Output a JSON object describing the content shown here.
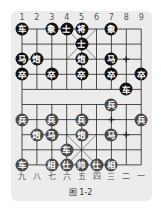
{
  "board": {
    "top_labels": [
      "1",
      "2",
      "3",
      "4",
      "5",
      "6",
      "7",
      "8",
      "9"
    ],
    "bottom_labels": [
      "九",
      "八",
      "七",
      "六",
      "五",
      "四",
      "三",
      "二",
      "一"
    ],
    "pieces": [
      {
        "char": "车",
        "side": "black",
        "col": 1,
        "row": 0
      },
      {
        "char": "象",
        "side": "black",
        "col": 3,
        "row": 0
      },
      {
        "char": "士",
        "side": "black",
        "col": 4,
        "row": 0
      },
      {
        "char": "将",
        "side": "black",
        "col": 5,
        "row": 0
      },
      {
        "char": "象",
        "side": "black",
        "col": 7,
        "row": 0
      },
      {
        "char": "士",
        "side": "black",
        "col": 5,
        "row": 1
      },
      {
        "char": "马",
        "side": "black",
        "col": 1,
        "row": 2
      },
      {
        "char": "炮",
        "side": "black",
        "col": 2,
        "row": 2
      },
      {
        "char": "炮",
        "side": "black",
        "col": 5,
        "row": 2
      },
      {
        "char": "马",
        "side": "black",
        "col": 7,
        "row": 2
      },
      {
        "char": "卒",
        "side": "black",
        "col": 1,
        "row": 3
      },
      {
        "char": "卒",
        "side": "black",
        "col": 3,
        "row": 3
      },
      {
        "char": "卒",
        "side": "black",
        "col": 5,
        "row": 3
      },
      {
        "char": "卒",
        "side": "black",
        "col": 7,
        "row": 3
      },
      {
        "char": "卒",
        "side": "black",
        "col": 9,
        "row": 3
      },
      {
        "char": "车",
        "side": "black",
        "col": 8,
        "row": 4
      },
      {
        "char": "兵",
        "side": "red",
        "col": 7,
        "row": 5
      },
      {
        "char": "兵",
        "side": "red",
        "col": 1,
        "row": 6
      },
      {
        "char": "兵",
        "side": "red",
        "col": 3,
        "row": 6
      },
      {
        "char": "兵",
        "side": "red",
        "col": 5,
        "row": 6
      },
      {
        "char": "兵",
        "side": "red",
        "col": 9,
        "row": 6
      },
      {
        "char": "炮",
        "side": "red",
        "col": 2,
        "row": 7
      },
      {
        "char": "马",
        "side": "red",
        "col": 3,
        "row": 7
      },
      {
        "char": "炮",
        "side": "red",
        "col": 5,
        "row": 7
      },
      {
        "char": "马",
        "side": "red",
        "col": 7,
        "row": 7
      },
      {
        "char": "车",
        "side": "red",
        "col": 4,
        "row": 8
      },
      {
        "char": "车",
        "side": "red",
        "col": 1,
        "row": 9
      },
      {
        "char": "相",
        "side": "red",
        "col": 3,
        "row": 9
      },
      {
        "char": "仕",
        "side": "red",
        "col": 4,
        "row": 9
      },
      {
        "char": "帅",
        "side": "red",
        "col": 5,
        "row": 9
      },
      {
        "char": "仕",
        "side": "red",
        "col": 6,
        "row": 9
      },
      {
        "char": "相",
        "side": "red",
        "col": 7,
        "row": 9
      }
    ],
    "markers": [
      {
        "col": 8,
        "row": 2
      },
      {
        "col": 7,
        "row": 6
      },
      {
        "col": 8,
        "row": 7
      }
    ]
  },
  "caption": "图 1-2"
}
